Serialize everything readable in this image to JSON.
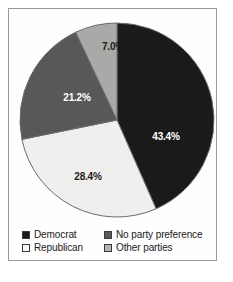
{
  "chart_data": {
    "type": "pie",
    "title": "",
    "subtitle": "",
    "xlabel": "",
    "ylabel": "",
    "legend_position": "bottom",
    "grid": false,
    "start_angle_deg": 0,
    "direction": "clockwise",
    "categories": [
      "Democrat",
      "Republican",
      "No party preference",
      "Other parties"
    ],
    "values": [
      43.4,
      28.4,
      21.2,
      7.0
    ],
    "value_unit": "%",
    "slices": [
      {
        "label": "Democrat",
        "value": 43.4,
        "value_text": "43.4%",
        "color": "#1a1a1a",
        "label_color": "#ffffff",
        "start_deg": 0,
        "end_deg": 156.24,
        "label_x": 157,
        "label_y": 128
      },
      {
        "label": "Republican",
        "value": 28.4,
        "value_text": "28.4%",
        "color": "#f0efed",
        "label_color": "#1b1b1b",
        "start_deg": 156.24,
        "end_deg": 258.48,
        "label_x": 79,
        "label_y": 168
      },
      {
        "label": "No party preference",
        "value": 21.2,
        "value_text": "21.2%",
        "color": "#585858",
        "label_color": "#ffffff",
        "start_deg": 258.48,
        "end_deg": 334.8,
        "label_x": 68,
        "label_y": 89
      },
      {
        "label": "Other parties",
        "value": 7.0,
        "value_text": "7.0%",
        "color": "#a9a9a7",
        "label_color": "#1b1b1b",
        "start_deg": 334.8,
        "end_deg": 360,
        "label_x": 104,
        "label_y": 38
      }
    ]
  },
  "legend": {
    "items": [
      {
        "label": "Democrat",
        "swatch_color": "#1a1a1a"
      },
      {
        "label": "No party preference",
        "swatch_color": "#585858"
      },
      {
        "label": "Republican",
        "swatch_color": "#f6f5f3"
      },
      {
        "label": "Other parties",
        "swatch_color": "#b4b4b2"
      }
    ]
  },
  "style": {
    "frame_color": "#9a9a9a",
    "background": "#ffffff",
    "slice_outline": "#6b6b6b"
  }
}
